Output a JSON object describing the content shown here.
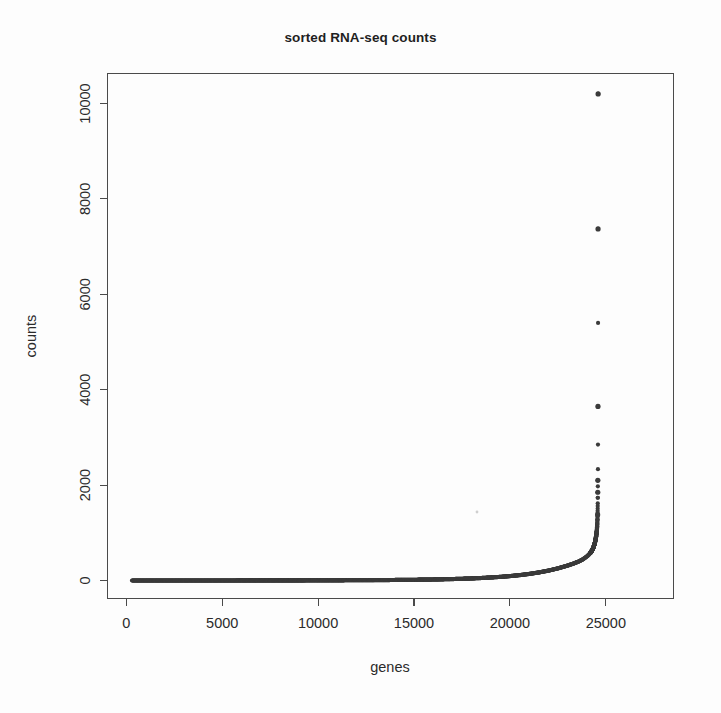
{
  "figure": {
    "title": "sorted RNA-seq counts",
    "background_color": "#fdfdfd",
    "foreground_color": "#3b3b3b"
  },
  "axes": {
    "x_label": "genes",
    "y_label": "counts",
    "x_ticks": [
      "0",
      "5000",
      "10000",
      "15000",
      "20000",
      "25000"
    ],
    "y_ticks": [
      "0",
      "2000",
      "4000",
      "6000",
      "8000",
      "10000"
    ]
  },
  "chart_data": {
    "type": "scatter",
    "title": "sorted RNA-seq counts",
    "xlabel": "genes",
    "ylabel": "counts",
    "xlim": [
      -500,
      25500
    ],
    "ylim": [
      -300,
      10600
    ],
    "grid": false,
    "legend": null,
    "point_color": "#3b3b3b",
    "point_size": 3,
    "x_tick_values": [
      0,
      5000,
      10000,
      15000,
      20000,
      25000
    ],
    "y_tick_values": [
      0,
      2000,
      4000,
      6000,
      8000,
      10000
    ],
    "n_points": 24600,
    "series": [
      {
        "name": "sorted counts",
        "x": [
          0,
          500,
          1000,
          1500,
          2000,
          2500,
          3000,
          3500,
          4000,
          4500,
          5000,
          5500,
          6000,
          6500,
          7000,
          7500,
          8000,
          8500,
          9000,
          9500,
          10000,
          10500,
          11000,
          11500,
          12000,
          12500,
          13000,
          13500,
          14000,
          14500,
          15000,
          15500,
          16000,
          16500,
          17000,
          17500,
          18000,
          18500,
          19000,
          19500,
          20000,
          20500,
          21000,
          21500,
          22000,
          22500,
          23000,
          23300,
          23600,
          23800,
          24000,
          24100,
          24200,
          24250,
          24300,
          24350,
          24400,
          24430,
          24460,
          24480,
          24500,
          24515,
          24530,
          24540,
          24550,
          24558,
          24565,
          24570,
          24575,
          24580,
          24584,
          24588,
          24591,
          24594,
          24596,
          24598,
          24600
        ],
        "y": [
          0,
          0,
          0,
          0,
          0,
          0,
          0,
          0,
          0,
          0,
          0,
          0,
          1,
          1,
          1,
          1,
          2,
          2,
          2,
          3,
          3,
          4,
          4,
          5,
          6,
          7,
          8,
          9,
          11,
          13,
          15,
          18,
          21,
          25,
          30,
          36,
          43,
          52,
          63,
          76,
          92,
          112,
          137,
          168,
          206,
          253,
          312,
          352,
          400,
          442,
          500,
          535,
          580,
          610,
          645,
          690,
          745,
          790,
          845,
          890,
          940,
          985,
          1040,
          1090,
          1150,
          1210,
          1290,
          1380,
          1480,
          1620,
          1850,
          2100,
          2450,
          3650,
          5400,
          7370,
          10200
        ]
      }
    ],
    "outliers": [
      {
        "label": "top gene",
        "x": 24600,
        "y": 10200
      },
      {
        "label": "2nd gene",
        "x": 24596,
        "y": 7370
      },
      {
        "label": "3rd gene",
        "x": 24591,
        "y": 3650
      },
      {
        "label": "4th gene",
        "x": 24584,
        "y": 2100
      },
      {
        "label": "5th gene",
        "x": 24581,
        "y": 1850
      },
      {
        "label": "6th gene",
        "x": 24575,
        "y": 1380
      }
    ]
  }
}
